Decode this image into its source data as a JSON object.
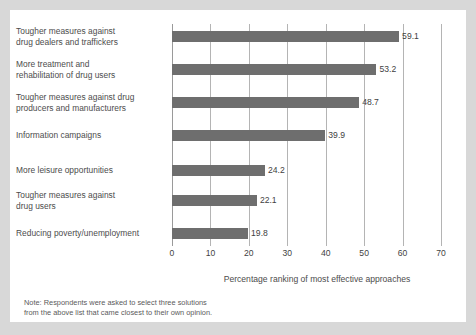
{
  "chart_data": {
    "type": "bar",
    "orientation": "horizontal",
    "title": "",
    "subtitle": "",
    "xlabel": "Percentage ranking of most effective approaches",
    "ylabel": "",
    "xlim": [
      0,
      70
    ],
    "xticks": [
      0,
      10,
      20,
      30,
      40,
      50,
      60,
      70
    ],
    "xtick_labels": [
      "0",
      "10",
      "20",
      "30",
      "40",
      "50",
      "60",
      "70"
    ],
    "grid": "vertical",
    "legend": "none",
    "bar_color": "#6e6e6e",
    "categories": [
      "Tougher measures against\ndrug dealers and traffickers",
      "More treatment and\nrehabilitation of drug users",
      "Tougher measures against drug\nproducers and manufacturers",
      "Information campaigns",
      "More leisure opportunities",
      "Tougher measures against\ndrug users",
      "Reducing poverty/unemployment"
    ],
    "values": [
      59.1,
      53.2,
      48.7,
      39.9,
      24.2,
      22.1,
      19.8
    ],
    "value_labels": [
      "59.1",
      "53.2",
      "48.7",
      "39.9",
      "24.2",
      "22.1",
      "19.8"
    ],
    "annotations": [
      "Note: Respondents were asked to select three solutions\nfrom the above list that came closest to their own opinion."
    ]
  },
  "note": "Note: Respondents were asked to select three solutions\nfrom the above list that came closest to their own opinion."
}
